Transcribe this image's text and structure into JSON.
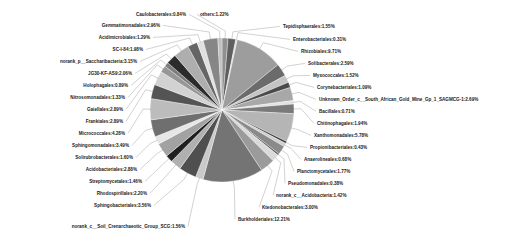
{
  "chart_data": {
    "type": "pie",
    "title": "",
    "subtitle": "",
    "xlabel": "",
    "ylabel": "",
    "legend_position": "none",
    "grid": false,
    "value_unit": "%",
    "label_format": "name:value%",
    "palette": "grayscale",
    "categories": [
      "others",
      "Tepidisphaerales",
      "Enterobacteriales",
      "Rhizobiales",
      "Solibacterales",
      "Myxococcales",
      "Corynebacteriales",
      "Unknown_Order_c__South_African_Gold_Mine_Gp_1_SAGMCG-1",
      "Bacillales",
      "Chitinophagales",
      "Xanthomonadales",
      "Propionibacteriales",
      "Anaerolineales",
      "Planctomycetales",
      "Pseudomonadales",
      "norank_c__Acidobacteria",
      "Ktedonobacterales",
      "Burkholderiales",
      "norank_c__Soil_Crenarchaeotic_Group_SCG",
      "Sphingobacteriales",
      "Rhodospirillales",
      "Streptomycetales",
      "Acidobacteriales",
      "Solirubrobacterales",
      "Sphingomonadales",
      "Micrococcales",
      "Frankiales",
      "Gaiellales",
      "Nitrosomonadales",
      "Holophagales",
      "JG30-KF-AS9",
      "norank_p__Saccharibacteria",
      "SC-I-84",
      "Acidimicrobiales",
      "Gemmatimonadales",
      "Caulobacterales"
    ],
    "values": [
      1.22,
      1.55,
      0.31,
      9.71,
      2.59,
      1.52,
      1.09,
      2.69,
      0.71,
      1.94,
      5.78,
      0.43,
      0.68,
      1.77,
      0.38,
      1.42,
      3.0,
      12.21,
      1.56,
      3.56,
      2.2,
      1.46,
      2.88,
      1.6,
      3.49,
      4.28,
      2.89,
      2.89,
      1.33,
      0.89,
      2.06,
      3.15,
      1.98,
      1.29,
      2.96,
      0.84
    ],
    "colors": [
      "#8f8f8f",
      "#5f5f5f",
      "#d8d8d8",
      "#9d9d9d",
      "#6b6b6b",
      "#c4c4c4",
      "#4a4a4a",
      "#a8a8a8",
      "#e2e2e2",
      "#7a7a7a",
      "#b5b5b5",
      "#3a3a3a",
      "#cfcfcf",
      "#8a8a8a",
      "#606060",
      "#dadada",
      "#9b9b9b",
      "#747474",
      "#c9c9c9",
      "#4f4f4f",
      "#b0b0b0",
      "#1f1f1f",
      "#a2a2a2",
      "#e6e6e6",
      "#6f6f6f",
      "#bcbcbc",
      "#545454",
      "#d2d2d2",
      "#969696",
      "#7e7e7e",
      "#2b2b2b",
      "#aeaeae",
      "#656565",
      "#e0e0e0",
      "#868686",
      "#c0c0c0"
    ]
  },
  "labels": {
    "others": "others:1.22%",
    "tepidisphaerales": "Tepidisphaerales:1.55%",
    "enterobacteriales": "Enterobacteriales:0.31%",
    "rhizobiales": "Rhizobiales:9.71%",
    "solibacterales": "Solibacterales:2.59%",
    "myxococcales": "Myxococcales:1.52%",
    "corynebacteriales": "Corynebacteriales:1.09%",
    "unknown_order_sagmcg1": "Unknown_Order_c__South_African_Gold_Mine_Gp_1_SAGMCG-1:2.69%",
    "bacillales": "Bacillales:0.71%",
    "chitinophagales": "Chitinophagales:1.94%",
    "xanthomonadales": "Xanthomonadales:5.78%",
    "propionibacteriales": "Propionibacteriales:0.43%",
    "anaerolineales": "Anaerolineales:0.68%",
    "planctomycetales": "Planctomycetales:1.77%",
    "pseudomonadales": "Pseudomonadales:0.38%",
    "norank_c_acidobacteria": "norank_c__Acidobacteria:1.42%",
    "ktedonobacterales": "Ktedonobacterales:3.00%",
    "burkholderiales": "Burkholderiales:12.21%",
    "norank_c_soil_scg": "norank_c__Soil_Crenarchaeotic_Group_SCG:1.56%",
    "sphingobacteriales": "Sphingobacteriales:3.56%",
    "rhodospirillales": "Rhodospirillales:2.20%",
    "streptomycetales": "Streptomycetales:1.46%",
    "acidobacteriales": "Acidobacteriales:2.88%",
    "solirubrobacterales": "Solirubrobacterales:1.60%",
    "sphingomonadales": "Sphingomonadales:3.49%",
    "micrococcales": "Micrococcales:4.28%",
    "frankiales": "Frankiales:2.89%",
    "gaiellales": "Gaiellales:2.89%",
    "nitrosomonadales": "Nitrosomonadales:1.33%",
    "holophagales": "Holophagales:0.89%",
    "jg30_kf_as9": "JG30-KF-AS9:2.06%",
    "norank_p_saccharibacteria": "norank_p__Saccharibacteria:3.15%",
    "sc_i_84": "SC-I-84:1.98%",
    "acidimicrobiales": "Acidimicrobiales:1.29%",
    "gemmatimonadales": "Gemmatimonadales:2.96%",
    "caulobacterales": "Caulobacterales:0.84%"
  }
}
